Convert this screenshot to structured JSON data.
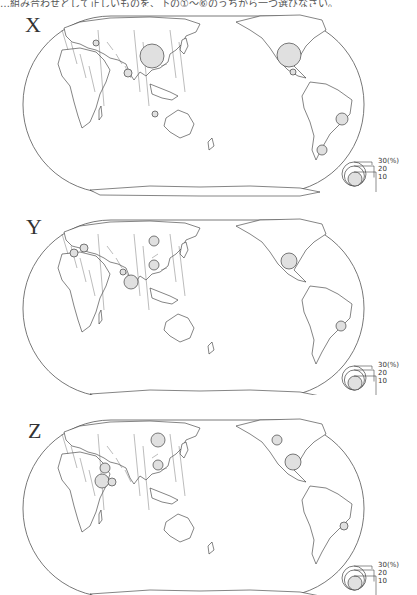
{
  "caption": "…組み合わせとして正しいものを、下の①～⑥のうちから一つ選びなさい。",
  "legend": {
    "unit": "(%)",
    "labels": [
      "30(%)",
      "20",
      "10"
    ],
    "values": [
      30,
      20,
      10
    ]
  },
  "circle_fill": "#e0e0e0",
  "outline_color": "#333333",
  "panels": [
    {
      "label": "X",
      "circles": [
        {
          "region": "China",
          "cx": 152,
          "cy": 36,
          "r": 12
        },
        {
          "region": "United States",
          "cx": 289,
          "cy": 35,
          "r": 12
        },
        {
          "region": "Ukraine",
          "cx": 96,
          "cy": 23,
          "r": 3
        },
        {
          "region": "India",
          "cx": 128,
          "cy": 53,
          "r": 4
        },
        {
          "region": "Indonesia",
          "cx": 155,
          "cy": 94,
          "r": 3
        },
        {
          "region": "Mexico",
          "cx": 293,
          "cy": 52,
          "r": 3
        },
        {
          "region": "Brazil",
          "cx": 342,
          "cy": 99,
          "r": 6
        },
        {
          "region": "Argentina",
          "cx": 322,
          "cy": 130,
          "r": 5
        }
      ]
    },
    {
      "label": "Y",
      "circles": [
        {
          "region": "France",
          "cx": 74,
          "cy": 29,
          "r": 4
        },
        {
          "region": "Germany",
          "cx": 84,
          "cy": 24,
          "r": 4
        },
        {
          "region": "Russia",
          "cx": 154,
          "cy": 17,
          "r": 5
        },
        {
          "region": "China",
          "cx": 154,
          "cy": 41,
          "r": 5
        },
        {
          "region": "Pakistan",
          "cx": 123,
          "cy": 48,
          "r": 3
        },
        {
          "region": "India",
          "cx": 131,
          "cy": 58,
          "r": 7
        },
        {
          "region": "United States",
          "cx": 289,
          "cy": 37,
          "r": 8
        },
        {
          "region": "Brazil",
          "cx": 341,
          "cy": 102,
          "r": 5
        }
      ]
    },
    {
      "label": "Z",
      "circles": [
        {
          "region": "Russia",
          "cx": 158,
          "cy": 16,
          "r": 7
        },
        {
          "region": "China",
          "cx": 158,
          "cy": 41,
          "r": 5
        },
        {
          "region": "Turkey",
          "cx": 105,
          "cy": 44,
          "r": 5
        },
        {
          "region": "Egypt",
          "cx": 102,
          "cy": 57,
          "r": 7
        },
        {
          "region": "Saudi Arabia",
          "cx": 112,
          "cy": 58,
          "r": 4
        },
        {
          "region": "Canada",
          "cx": 277,
          "cy": 16,
          "r": 5
        },
        {
          "region": "United States",
          "cx": 293,
          "cy": 38,
          "r": 8
        },
        {
          "region": "Brazil",
          "cx": 344,
          "cy": 102,
          "r": 4
        }
      ]
    }
  ]
}
